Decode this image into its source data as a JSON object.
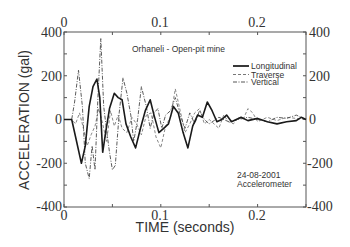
{
  "chart_data": {
    "type": "line",
    "title": "Orhaneli - Open-pit mine",
    "xlabel": "TIME (seconds)",
    "ylabel": "ACCELERATION (gal)",
    "xlim": [
      0,
      0.25
    ],
    "ylim": [
      -400,
      400
    ],
    "x_ticks": [
      0,
      0.1,
      0.2
    ],
    "x_tick_labels": [
      "0",
      "0.1",
      "0.2"
    ],
    "x_minor_ticks": [
      0.05,
      0.15,
      0.25
    ],
    "y_ticks": [
      -400,
      -200,
      0,
      200,
      400
    ],
    "y_tick_labels": [
      "-400",
      "-200",
      "0",
      "200",
      "400"
    ],
    "y_minor_ticks": [
      -300,
      -100,
      100,
      300
    ],
    "grid": false,
    "mirrored_axes": true,
    "legend_position": "upper right",
    "annotations": [
      "Orhaneli - Open-pit mine",
      "24-08-2001",
      "Accelerometer"
    ],
    "series": [
      {
        "name": "Longitudinal",
        "style": "solid",
        "x": [
          0,
          0.008,
          0.012,
          0.018,
          0.022,
          0.026,
          0.03,
          0.034,
          0.037,
          0.04,
          0.043,
          0.047,
          0.052,
          0.056,
          0.06,
          0.064,
          0.069,
          0.074,
          0.079,
          0.084,
          0.089,
          0.093,
          0.098,
          0.103,
          0.108,
          0.113,
          0.118,
          0.123,
          0.128,
          0.133,
          0.138,
          0.143,
          0.148,
          0.153,
          0.158,
          0.163,
          0.168,
          0.173,
          0.178,
          0.183,
          0.19,
          0.2,
          0.21,
          0.22,
          0.23,
          0.24,
          0.245,
          0.25
        ],
        "y": [
          0,
          0,
          -80,
          -200,
          -120,
          60,
          150,
          185,
          100,
          -150,
          -60,
          50,
          120,
          100,
          90,
          -20,
          -80,
          -130,
          -40,
          40,
          90,
          20,
          -60,
          -40,
          -20,
          60,
          30,
          -60,
          -130,
          -30,
          20,
          10,
          80,
          40,
          -10,
          0,
          20,
          -10,
          0,
          10,
          -5,
          5,
          -10,
          -20,
          -10,
          -5,
          10,
          0
        ]
      },
      {
        "name": "Traverse",
        "style": "dashed",
        "x": [
          0,
          0.008,
          0.012,
          0.016,
          0.02,
          0.024,
          0.028,
          0.032,
          0.036,
          0.04,
          0.044,
          0.048,
          0.052,
          0.056,
          0.06,
          0.065,
          0.07,
          0.075,
          0.08,
          0.085,
          0.09,
          0.095,
          0.1,
          0.105,
          0.11,
          0.115,
          0.12,
          0.125,
          0.13,
          0.135,
          0.14,
          0.145,
          0.15,
          0.155,
          0.16,
          0.165,
          0.17,
          0.175,
          0.18,
          0.185,
          0.19,
          0.195,
          0.2,
          0.21,
          0.22,
          0.23,
          0.24,
          0.25
        ],
        "y": [
          0,
          0,
          -20,
          30,
          -40,
          -120,
          -70,
          -30,
          50,
          -20,
          -100,
          40,
          -30,
          20,
          -40,
          -60,
          10,
          -20,
          -70,
          20,
          30,
          -80,
          -130,
          -30,
          10,
          140,
          40,
          -60,
          -20,
          30,
          50,
          -20,
          0,
          -20,
          -40,
          20,
          -10,
          -20,
          10,
          0,
          50,
          30,
          -10,
          10,
          -5,
          10,
          5,
          0
        ]
      },
      {
        "name": "Vertical",
        "style": "dashdot",
        "x": [
          0,
          0.008,
          0.011,
          0.015,
          0.019,
          0.022,
          0.026,
          0.029,
          0.032,
          0.035,
          0.038,
          0.041,
          0.044,
          0.047,
          0.05,
          0.053,
          0.057,
          0.061,
          0.065,
          0.069,
          0.072,
          0.076,
          0.08,
          0.085,
          0.089,
          0.093,
          0.097,
          0.101,
          0.105,
          0.11,
          0.115,
          0.12,
          0.125,
          0.13,
          0.135,
          0.14,
          0.145,
          0.15,
          0.16,
          0.17,
          0.18,
          0.19,
          0.2,
          0.21,
          0.22,
          0.23,
          0.24,
          0.25
        ],
        "y": [
          0,
          0,
          80,
          225,
          60,
          -200,
          -270,
          -120,
          -230,
          100,
          370,
          60,
          -50,
          -150,
          -230,
          -210,
          30,
          190,
          120,
          20,
          -100,
          0,
          150,
          60,
          -40,
          30,
          50,
          -40,
          20,
          40,
          100,
          20,
          -40,
          30,
          -20,
          40,
          0,
          -20,
          10,
          -10,
          0,
          10,
          0,
          -10,
          10,
          5,
          20,
          0
        ]
      }
    ]
  },
  "labels": {
    "title": "Orhaneli - Open-pit mine",
    "xlabel": "TIME (seconds)",
    "ylabel": "ACCELERATION (gal)",
    "date": "24-08-2001",
    "instrument": "Accelerometer",
    "legend": [
      "Longitudinal",
      "Traverse",
      "Vertical"
    ],
    "x_ticks": [
      "0",
      "0.1",
      "0.2"
    ],
    "y_ticks_left": [
      "400",
      "200",
      "0",
      "-200",
      "-400"
    ],
    "y_ticks_right": [
      "400",
      "200",
      "0",
      "-200",
      "-400"
    ]
  }
}
